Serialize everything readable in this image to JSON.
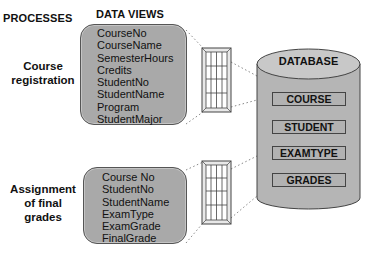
{
  "headers": {
    "processes": "PROCESSES",
    "data_views": "DATA VIEWS"
  },
  "processes": [
    {
      "label_lines": [
        "Course",
        "registration"
      ]
    },
    {
      "label_lines": [
        "Assignment",
        "of final",
        "grades"
      ]
    }
  ],
  "data_views": [
    {
      "fields": [
        "CourseNo",
        "CourseName",
        "SemesterHours",
        "Credits",
        "StudentNo",
        "StudentName",
        "Program",
        "StudentMajor"
      ]
    },
    {
      "fields": [
        "Course No",
        "StudentNo",
        "StudentName",
        "ExamType",
        "ExamGrade",
        "FinalGrade"
      ]
    }
  ],
  "database": {
    "title": "DATABASE",
    "tables": [
      "COURSE",
      "STUDENT",
      "EXAMTYPE",
      "GRADES"
    ]
  },
  "icons": [
    "table-grid-icon",
    "table-grid-icon",
    "database-cylinder-icon"
  ],
  "colors": {
    "view_fill": "#a9a9a9",
    "cylinder_fill": "#b5b5b5",
    "cylinder_top": "#c8c8c8",
    "table_fill": "#b2b2b2",
    "outline": "#444444"
  }
}
